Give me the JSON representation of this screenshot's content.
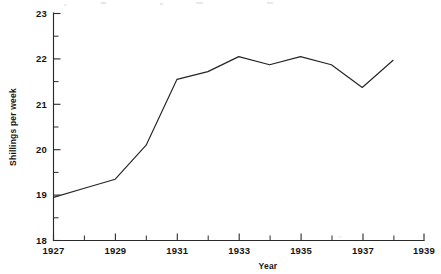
{
  "chart_data": {
    "type": "line",
    "title": "",
    "xlabel": "Year",
    "ylabel": "Shillings per week",
    "xlim": [
      1927,
      1939
    ],
    "ylim": [
      18,
      23
    ],
    "grid": false,
    "legend": null,
    "x": [
      1927,
      1928,
      1929,
      1930,
      1931,
      1932,
      1933,
      1934,
      1935,
      1936,
      1937,
      1938
    ],
    "values": [
      18.95,
      19.15,
      19.35,
      20.1,
      21.55,
      21.72,
      22.05,
      21.87,
      22.05,
      21.87,
      21.37,
      21.97
    ],
    "series": [
      {
        "name": "Shillings per week",
        "values": [
          18.95,
          19.15,
          19.35,
          20.1,
          21.55,
          21.72,
          22.05,
          21.87,
          22.05,
          21.87,
          21.37,
          21.97
        ],
        "color": "#242424"
      }
    ],
    "x_tick_values": [
      1927,
      1928,
      1929,
      1930,
      1931,
      1932,
      1933,
      1934,
      1935,
      1936,
      1937,
      1938,
      1939
    ],
    "x_tick_labels": [
      "1927",
      "",
      "1929",
      "",
      "1931",
      "",
      "1933",
      "",
      "1935",
      "",
      "1937",
      "",
      "1939"
    ],
    "y_tick_values": [
      18,
      18.5,
      19,
      19.5,
      20,
      20.5,
      21,
      21.5,
      22,
      22.5,
      23
    ],
    "y_tick_labels": [
      "18",
      "",
      "19",
      "",
      "20",
      "",
      "21",
      "",
      "22",
      "",
      "23"
    ],
    "y_major_labels": [
      "18",
      "19",
      "20",
      "21",
      "22",
      "23"
    ],
    "line_color": "#242424",
    "axis_color": "#2a2a2a"
  },
  "axes": {
    "y_title": "Shillings per week",
    "x_title": "Year"
  }
}
